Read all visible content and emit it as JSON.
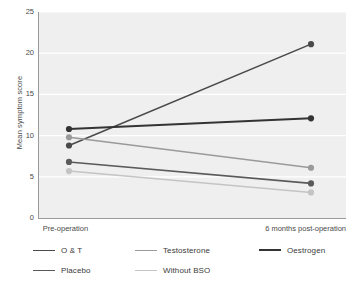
{
  "chart_data": {
    "type": "line",
    "title": "",
    "xlabel": "",
    "ylabel": "Mean symptom score",
    "categories": [
      "Pre-operation",
      "6 months post-operation"
    ],
    "x": [
      0,
      1
    ],
    "ylim": [
      0,
      25
    ],
    "yticks": [
      0,
      5,
      10,
      15,
      20,
      25
    ],
    "ytick_labels": [
      "0",
      "5",
      "10",
      "15",
      "20",
      "25"
    ],
    "grid": "horizontal-white-on-gray",
    "legend_position": "bottom-left",
    "series": [
      {
        "name": "O & T",
        "values": [
          8.8,
          21.1
        ],
        "color": "#4a4a4a",
        "width": 1.6
      },
      {
        "name": "Testosterone",
        "values": [
          9.8,
          6.1
        ],
        "color": "#9a9a9a",
        "width": 1.4
      },
      {
        "name": "Oestrogen",
        "values": [
          10.8,
          12.1
        ],
        "color": "#333333",
        "width": 2.0
      },
      {
        "name": "Placebo",
        "values": [
          6.8,
          4.2
        ],
        "color": "#5a5a5a",
        "width": 1.6
      },
      {
        "name": "Without BSO",
        "values": [
          5.7,
          3.1
        ],
        "color": "#c4c4c4",
        "width": 1.4
      }
    ]
  },
  "legend": {
    "rows": [
      [
        "O & T",
        "Testosterone",
        "Oestrogen"
      ],
      [
        "Placebo",
        "Without BSO"
      ]
    ]
  },
  "colors": {
    "plot_background": "#efefef",
    "gridline": "#ffffff",
    "axis": "#9a9a9a",
    "text": "#4a4a4a"
  }
}
